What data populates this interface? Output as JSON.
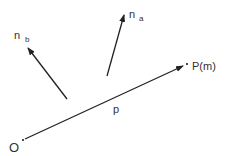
{
  "diagram": {
    "title": "",
    "points": {
      "origin": {
        "label": "O",
        "x": 23,
        "y": 140
      },
      "target": {
        "label": "P(m)",
        "x": 186,
        "y": 64
      }
    },
    "vectors": [
      {
        "id": "p",
        "label": "p",
        "from": [
          23,
          140
        ],
        "to": [
          184,
          65
        ]
      },
      {
        "id": "n_a",
        "label_main": "n",
        "label_sub": "a",
        "from": [
          107,
          76
        ],
        "to": [
          124,
          14
        ]
      },
      {
        "id": "n_b",
        "label_main": "n",
        "label_sub": "b",
        "from": [
          67,
          99
        ],
        "to": [
          28,
          47
        ]
      }
    ],
    "labels": {
      "origin": "O",
      "target": "P(m)",
      "p": "p",
      "na_main": "n",
      "na_sub": "a",
      "nb_main": "n",
      "nb_sub": "b"
    },
    "colors": {
      "line": "#222222",
      "text": "#333333"
    }
  }
}
